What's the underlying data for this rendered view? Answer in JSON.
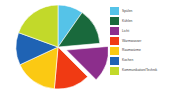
{
  "background_color": "#ffffff",
  "chart_data": {
    "type": "pie",
    "title": "",
    "subtitle": "",
    "xlabel": "",
    "ylabel": "",
    "grid": false,
    "legend_position": "right",
    "start_angle_deg": 0,
    "direction": "clockwise",
    "exploded_slice": "Licht",
    "categories": [
      "Spülen",
      "Kühlen",
      "Licht",
      "Warmwasser",
      "Raumwärme",
      "Kochen",
      "Kommunikation/Technik"
    ],
    "values": [
      9.7,
      13.9,
      13.9,
      13.9,
      16.7,
      12.5,
      19.4
    ],
    "angles_deg": [
      35,
      50,
      50,
      50,
      60,
      45,
      70
    ],
    "colors": [
      "#55C3E8",
      "#19693C",
      "#8C2E8C",
      "#F03A13",
      "#FBC913",
      "#1F63B4",
      "#C2D92A"
    ]
  },
  "legend": {
    "items": [
      {
        "label": "Spülen",
        "color": "#55C3E8"
      },
      {
        "label": "Kühlen",
        "color": "#19693C"
      },
      {
        "label": "Licht",
        "color": "#8C2E8C"
      },
      {
        "label": "Warmwasser",
        "color": "#F03A13"
      },
      {
        "label": "Raumwärme",
        "color": "#FBC913"
      },
      {
        "label": "Kochen",
        "color": "#1F63B4"
      },
      {
        "label": "Kommunikation/Technik",
        "color": "#C2D92A"
      }
    ]
  }
}
